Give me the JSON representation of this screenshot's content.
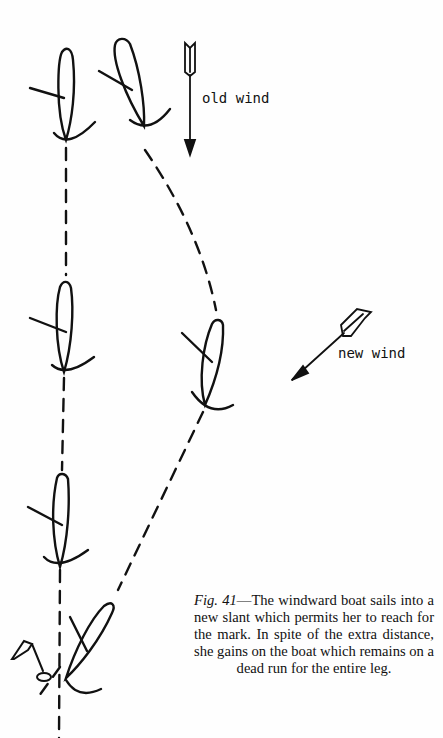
{
  "figure": {
    "labels": {
      "old_wind": "old wind",
      "new_wind": "new wind"
    },
    "caption": {
      "fig_ref": "Fig. 41",
      "dash": "—",
      "text": "The windward boat sails into a new slant which permits her to reach for the mark. In spite of the extra distance, she gains on the boat which remains on a dead run for the entire leg."
    },
    "elements": {
      "leeward_boat_positions": 3,
      "windward_boat_positions": 2,
      "boats_at_mark": 1,
      "mark": "flag-buoy"
    },
    "colors": {
      "ink": "#111111",
      "paper": "#fefefe"
    }
  }
}
